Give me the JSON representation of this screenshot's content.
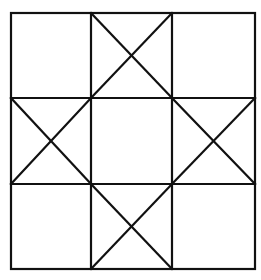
{
  "diagram": {
    "type": "quilt-block-ohio-star",
    "grid": {
      "rows": 3,
      "cols": 3
    },
    "outer": {
      "x1": 11,
      "y1": 13,
      "x2": 255,
      "y2": 269
    },
    "verticals": [
      91,
      172
    ],
    "horizontals": [
      98,
      184
    ],
    "crossed_cells": [
      "top-middle",
      "middle-left",
      "middle-right",
      "bottom-middle"
    ],
    "empty_cells": [
      "top-left",
      "top-right",
      "center",
      "bottom-left",
      "bottom-right"
    ],
    "line_color": "#111111",
    "background": "#ffffff"
  }
}
